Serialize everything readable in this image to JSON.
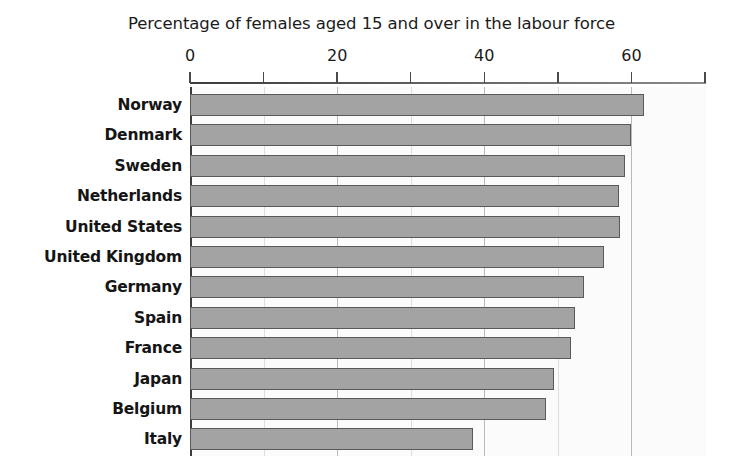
{
  "chart_data": {
    "type": "bar",
    "orientation": "horizontal",
    "title": "Percentage of females aged 15 and over in the labour force",
    "xlabel": "",
    "ylabel": "",
    "xlim": [
      0,
      70
    ],
    "ylim": null,
    "grid": true,
    "legend": null,
    "categories": [
      "Norway",
      "Denmark",
      "Sweden",
      "Netherlands",
      "United States",
      "United Kingdom",
      "Germany",
      "Spain",
      "France",
      "Japan",
      "Belgium",
      "Italy"
    ],
    "values": [
      61.7,
      60.0,
      59.1,
      58.3,
      58.5,
      56.3,
      53.5,
      52.3,
      51.8,
      49.5,
      48.4,
      38.5
    ],
    "tick_values": [
      0,
      10,
      20,
      30,
      40,
      50,
      60,
      70
    ],
    "labeled_ticks": [
      "0",
      "20",
      "40",
      "60"
    ],
    "major_gridline_values": [
      20,
      40,
      60
    ],
    "minor_gridline_values": [
      10,
      30,
      50
    ],
    "bar_fill_color": "#a3a3a3",
    "bar_border_color": "#595959",
    "axis_color": "#3d3d3d",
    "plot_background_color": "#fbfbfb"
  }
}
